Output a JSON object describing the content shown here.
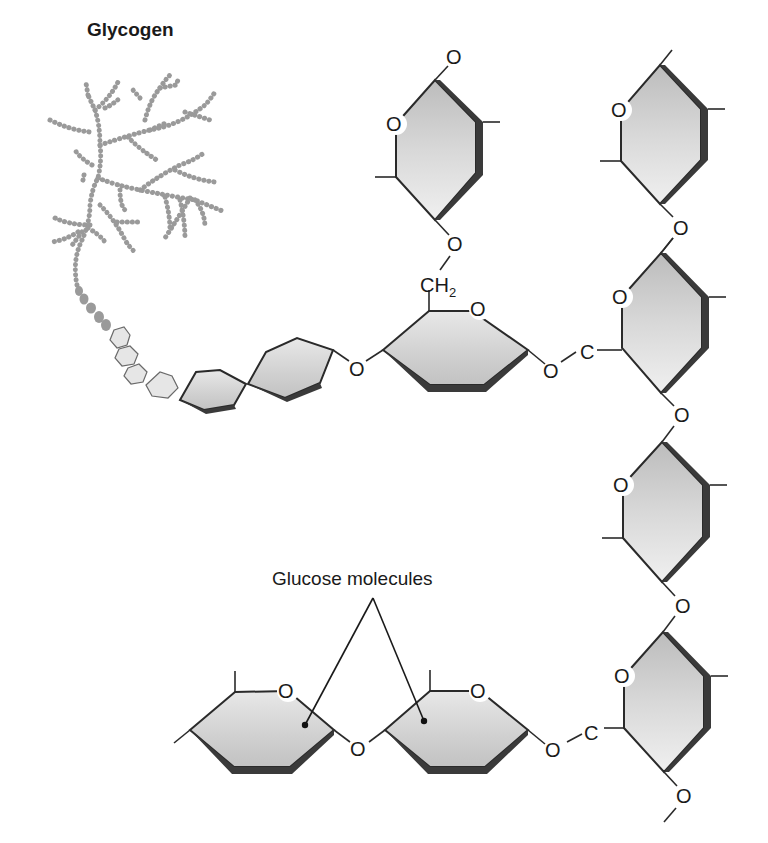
{
  "figure": {
    "title": "Glycogen",
    "callout_label": "Glucose molecules",
    "atom_labels": {
      "oxygen": "O",
      "carbon": "C",
      "ch2_main": "CH",
      "ch2_sub": "2"
    }
  },
  "colors": {
    "ring_fill_light": "#eeeeee",
    "ring_fill_dark": "#bdbdbd",
    "ring_shadow": "#3a3a3a",
    "stroke": "#2a2a2a",
    "branch_dots": "#9a9a9a"
  },
  "structure": {
    "description": "Glycogen branched polymer of glucose units with alpha-1,4 and alpha-1,6 (CH2) glycosidic linkages",
    "main_chain_rings": 2,
    "side_chain_rings": 1,
    "right_column_rings": 4,
    "bottom_chain_rings": 2,
    "labeled_glucose_molecules": 2
  }
}
